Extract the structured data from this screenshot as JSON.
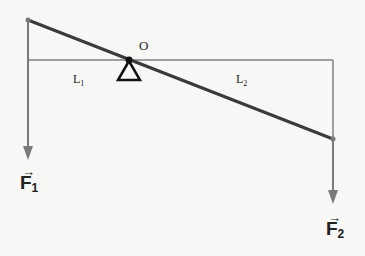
{
  "diagram": {
    "pivot_label": "O",
    "lengths": [
      {
        "label": "L",
        "subscript": "1"
      },
      {
        "label": "L",
        "subscript": "2"
      }
    ],
    "forces": [
      {
        "label": "F",
        "subscript": "1",
        "vector_arrow": "→"
      },
      {
        "label": "F",
        "subscript": "2",
        "vector_arrow": "→"
      }
    ],
    "colors": {
      "beam": "#3a3a3a",
      "reference_lines": "#808080",
      "force_arrows": "#7a7a7a",
      "pivot": "#111111",
      "background": "#f7f7f5"
    }
  }
}
